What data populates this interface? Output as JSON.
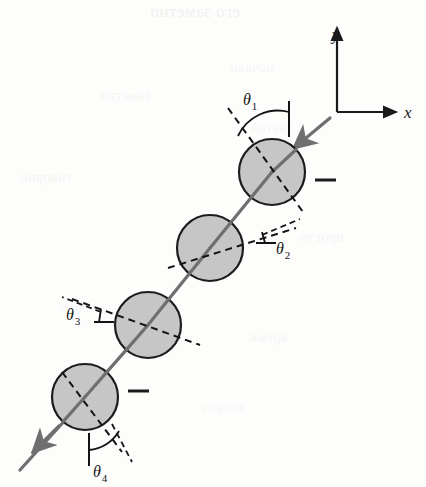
{
  "figure": {
    "kind": "ray-optics-diagram",
    "background_color": "#fdfdfc"
  },
  "axes": {
    "origin": {
      "x": 337,
      "y": 112
    },
    "x_axis": {
      "label": "x",
      "label_x": 404,
      "label_y": 118,
      "end_x": 396,
      "end_y": 112
    },
    "y_axis": {
      "label": "y",
      "label_x": 332,
      "label_y": 40,
      "end_x": 337,
      "end_y": 28
    },
    "color": "#1a1a1a"
  },
  "spheres": [
    {
      "id": "sphere-1",
      "cx": 272,
      "cy": 172,
      "r": 33
    },
    {
      "id": "sphere-2",
      "cx": 210,
      "cy": 248,
      "r": 33
    },
    {
      "id": "sphere-3",
      "cx": 148,
      "cy": 325,
      "r": 33
    },
    {
      "id": "sphere-4",
      "cx": 85,
      "cy": 397,
      "r": 33
    }
  ],
  "sphere_style": {
    "fill": "#c6c6c6",
    "stroke": "#1c1c1c",
    "stroke_width": 2.2
  },
  "ray": {
    "color": "#6f6f6f",
    "stroke_width": 3.2,
    "incoming_from": {
      "x": 330,
      "y": 118
    },
    "outgoing_to": {
      "x": 20,
      "y": 470
    },
    "arrow_in_at": {
      "x": 300,
      "y": 147
    },
    "arrow_out_at": {
      "x": 33,
      "y": 452
    }
  },
  "normals": {
    "color": "#141414",
    "dash": "7,5",
    "stroke_width": 2.0,
    "lines": [
      {
        "for": "sphere-1",
        "x1": 228,
        "y1": 108,
        "x2": 303,
        "y2": 212
      },
      {
        "for": "sphere-2",
        "x1": 168,
        "y1": 268,
        "x2": 296,
        "y2": 228
      },
      {
        "for": "sphere-3",
        "x1": 72,
        "y1": 299,
        "x2": 200,
        "y2": 345
      },
      {
        "for": "sphere-4",
        "x1": 62,
        "y1": 372,
        "x2": 122,
        "y2": 452
      }
    ]
  },
  "angles": [
    {
      "id": "theta-1",
      "label": "θ",
      "subscript": "1",
      "label_x": 243,
      "label_y": 105,
      "tick": {
        "x1": 289,
        "y1": 101,
        "x2": 289,
        "y2": 137
      },
      "arc": "M 238 136 A 44 44 0 0 1 289 112"
    },
    {
      "id": "theta-2",
      "label": "θ",
      "subscript": "2",
      "label_x": 276,
      "label_y": 254,
      "tick": {
        "x1": 256,
        "y1": 243,
        "x2": 276,
        "y2": 243
      },
      "arc": "M 262 232 L 265 243"
    },
    {
      "id": "theta-3",
      "label": "θ",
      "subscript": "3",
      "label_x": 66,
      "label_y": 320,
      "tick": {
        "x1": 94,
        "y1": 322,
        "x2": 114,
        "y2": 322
      },
      "arc": "M 101 309 L 99 322"
    },
    {
      "id": "theta-4",
      "label": "θ",
      "subscript": "4",
      "label_x": 93,
      "label_y": 477,
      "tick": {
        "x1": 89,
        "y1": 433,
        "x2": 89,
        "y2": 466
      },
      "arc": "M 89 450 A 38 38 0 0 0 119 431"
    }
  ],
  "dash_marks": [
    {
      "id": "dash-mark-1",
      "x1": 315,
      "y1": 180,
      "x2": 336,
      "y2": 180
    },
    {
      "id": "dash-mark-4",
      "x1": 128,
      "y1": 391,
      "x2": 149,
      "y2": 391
    }
  ],
  "angle_dashes": [
    {
      "id": "theta-2-ref-dash",
      "x1": 262,
      "y1": 235,
      "x2": 300,
      "y2": 219
    },
    {
      "id": "theta-3-ref-dash",
      "x1": 101,
      "y1": 312,
      "x2": 62,
      "y2": 297
    },
    {
      "id": "theta-4-ref-dash",
      "x1": 112,
      "y1": 424,
      "x2": 132,
      "y2": 462
    }
  ],
  "bleed_through": [
    {
      "text": "его заметно",
      "x": 150,
      "y": 2,
      "size": 17,
      "opacity": 0.3
    },
    {
      "text": "заметил",
      "x": 100,
      "y": 88,
      "size": 14,
      "opacity": 0.22
    },
    {
      "text": "говорил",
      "x": 20,
      "y": 170,
      "size": 14,
      "opacity": 0.22
    },
    {
      "text": "начало",
      "x": 230,
      "y": 60,
      "size": 14,
      "opacity": 0.2
    },
    {
      "text": "другой",
      "x": 250,
      "y": 120,
      "size": 14,
      "opacity": 0.2
    },
    {
      "text": "просто",
      "x": 300,
      "y": 230,
      "size": 14,
      "opacity": 0.2
    },
    {
      "text": "слово",
      "x": 60,
      "y": 300,
      "size": 14,
      "opacity": 0.18
    },
    {
      "text": "время",
      "x": 250,
      "y": 330,
      "size": 14,
      "opacity": 0.18
    },
    {
      "text": "вопрос",
      "x": 200,
      "y": 400,
      "size": 14,
      "opacity": 0.18
    }
  ]
}
